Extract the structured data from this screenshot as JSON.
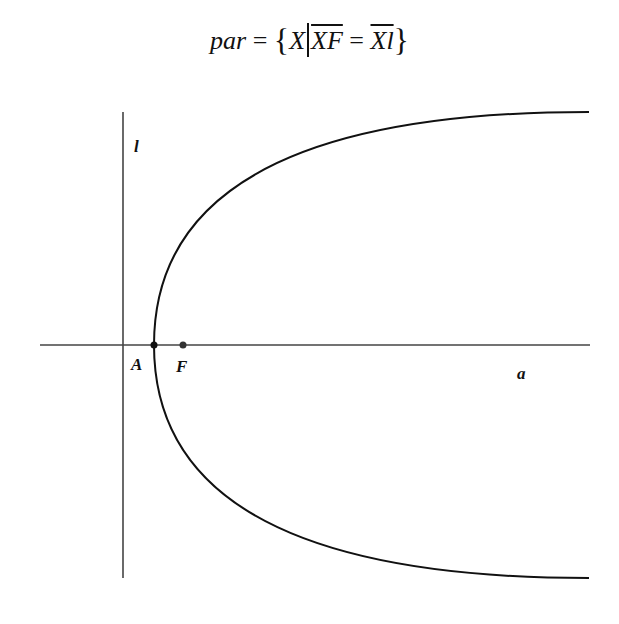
{
  "title": {
    "lhs": "par",
    "eq": "=",
    "open_brace": "{",
    "var": "X",
    "seg1": "XF",
    "eq2": "=",
    "seg2": "Xl",
    "close_brace": "}"
  },
  "labels": {
    "directrix": "l",
    "vertex": "A",
    "focus": "F",
    "axis": "a"
  },
  "colors": {
    "stroke": "#111111",
    "axis": "#444444"
  }
}
